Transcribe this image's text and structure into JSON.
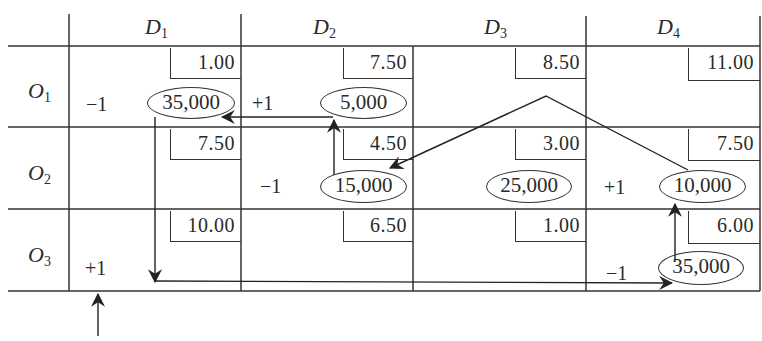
{
  "table": {
    "columns": [
      {
        "letter": "D",
        "sub": "1"
      },
      {
        "letter": "D",
        "sub": "2"
      },
      {
        "letter": "D",
        "sub": "3"
      },
      {
        "letter": "D",
        "sub": "4"
      }
    ],
    "rows": [
      {
        "letter": "O",
        "sub": "1"
      },
      {
        "letter": "O",
        "sub": "2"
      },
      {
        "letter": "O",
        "sub": "3"
      }
    ],
    "costs": [
      [
        "1.00",
        "7.50",
        "8.50",
        "11.00"
      ],
      [
        "7.50",
        "4.50",
        "3.00",
        "7.50"
      ],
      [
        "10.00",
        "6.50",
        "1.00",
        "6.00"
      ]
    ],
    "allocations": [
      [
        "35,000",
        "5,000",
        "",
        ""
      ],
      [
        "",
        "15,000",
        "25,000",
        "10,000"
      ],
      [
        "",
        "",
        "",
        "35,000"
      ]
    ],
    "signs": [
      [
        "−1",
        "+1",
        "",
        ""
      ],
      [
        "",
        "−1",
        "",
        "+1"
      ],
      [
        "+1",
        "",
        "",
        "−1"
      ]
    ]
  },
  "colors": {
    "line": "#333333",
    "text": "#2a2a2a",
    "background": "#ffffff"
  }
}
